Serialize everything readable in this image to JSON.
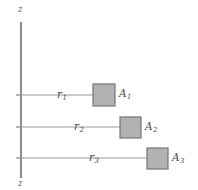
{
  "figure": {
    "type": "technical-diagram",
    "background_color": "#ffffff",
    "axis": {
      "name": "z-axis",
      "top_label": "z",
      "bottom_label": "z",
      "color": "#8c8c8c",
      "x": 21,
      "y_top": 22,
      "y_bottom": 178
    },
    "patch_fill_color": "#b2b2b2",
    "patch_stroke_color": "#767676",
    "leader_color": "#9a9a9a",
    "text_color": "#4a4a4a",
    "rows": [
      {
        "radius_label": "r",
        "radius_subscript": "1",
        "area_label": "A",
        "area_subscript": "1",
        "y": 95,
        "leader_start_x": 21,
        "leader_end_x": 105,
        "radius_label_x": 57,
        "radius_label_y": 89,
        "patch_x": 93,
        "patch_y": 84,
        "patch_size": 22,
        "area_label_x": 119,
        "area_label_y": 88
      },
      {
        "radius_label": "r",
        "radius_subscript": "2",
        "area_label": "A",
        "area_subscript": "2",
        "y": 127,
        "leader_start_x": 21,
        "leader_end_x": 131,
        "radius_label_x": 74,
        "radius_label_y": 121,
        "patch_x": 120,
        "patch_y": 117,
        "patch_size": 21,
        "area_label_x": 145,
        "area_label_y": 121
      },
      {
        "radius_label": "r",
        "radius_subscript": "3",
        "area_label": "A",
        "area_subscript": "3",
        "y": 158,
        "leader_start_x": 21,
        "leader_end_x": 158,
        "radius_label_x": 89,
        "radius_label_y": 152,
        "patch_x": 147,
        "patch_y": 148,
        "patch_size": 21,
        "area_label_x": 172,
        "area_label_y": 152
      }
    ]
  }
}
